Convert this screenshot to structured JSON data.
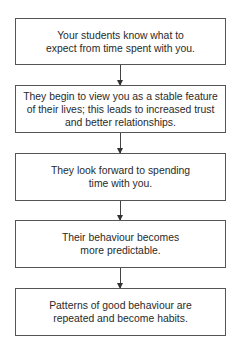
{
  "flowchart": {
    "steps": [
      {
        "text": "Your students know what to expect from time spent with you."
      },
      {
        "text": "They begin to view you as a stable feature of their lives; this leads to increased trust and better relationships."
      },
      {
        "text": "They look forward to spending time with you."
      },
      {
        "text": "Their behaviour becomes more predictable."
      },
      {
        "text": "Patterns of good behaviour are repeated and become habits."
      }
    ],
    "connector": "down-arrow"
  }
}
